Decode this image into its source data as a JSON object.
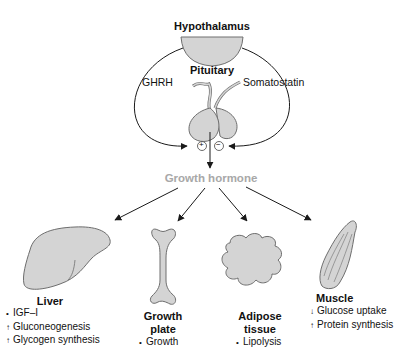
{
  "nodes": {
    "hypothalamus": "Hypothalamus",
    "pituitary": "Pituitary",
    "ghrh": "GHRH",
    "somatostatin": "Somatostatin",
    "plus": "+",
    "minus": "−",
    "growth_hormone": "Growth hormone"
  },
  "targets": [
    {
      "name": "Liver",
      "name_lines": [
        "Liver"
      ],
      "effects": [
        {
          "marker": "•",
          "direction": "none",
          "text": "IGF–I"
        },
        {
          "marker": "↑",
          "direction": "increase",
          "text": "Gluconeogenesis"
        },
        {
          "marker": "↑",
          "direction": "increase",
          "text": "Glycogen synthesis"
        }
      ]
    },
    {
      "name": "Growth plate",
      "name_lines": [
        "Growth",
        "plate"
      ],
      "effects": [
        {
          "marker": "•",
          "direction": "none",
          "text": "Growth"
        }
      ]
    },
    {
      "name": "Adipose tissue",
      "name_lines": [
        "Adipose",
        "tissue"
      ],
      "effects": [
        {
          "marker": "•",
          "direction": "none",
          "text": "Lipolysis"
        }
      ]
    },
    {
      "name": "Muscle",
      "name_lines": [
        "Muscle"
      ],
      "effects": [
        {
          "marker": "↓",
          "direction": "decrease",
          "text": "Glucose uptake"
        },
        {
          "marker": "↑",
          "direction": "increase",
          "text": "Protein synthesis"
        }
      ]
    }
  ],
  "colors": {
    "organ_fill": "#d4d4d4",
    "organ_stroke": "#6e6e6e",
    "line": "#1a1a1a",
    "growth_hormone_text": "#a8a8a8"
  }
}
